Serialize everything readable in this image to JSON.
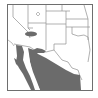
{
  "map": {
    "title": "Species range map",
    "region": "Southwestern United States and Northern Mexico",
    "type": "range map",
    "colors": {
      "background": "#ffffff",
      "land": "#ffffff",
      "border_lines": "#8a8a8a",
      "frame": "#6e6e6e",
      "range_fill": "#6b6b6b",
      "water": "#ffffff"
    },
    "legend": [],
    "labels": []
  }
}
